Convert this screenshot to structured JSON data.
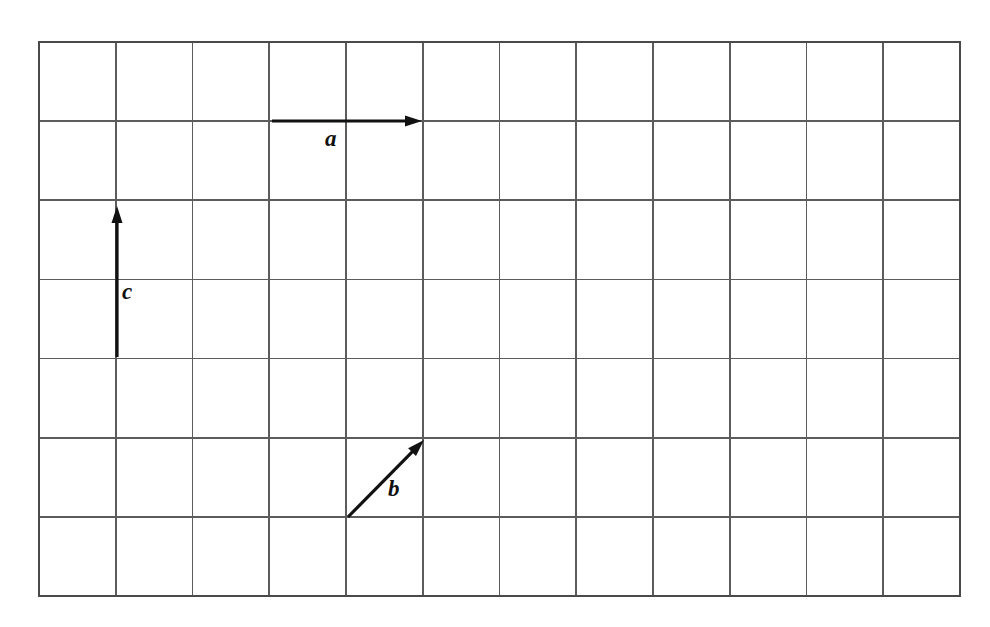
{
  "figure": {
    "background_color": "#ffffff",
    "grid": {
      "columns": 12,
      "rows": 7,
      "left": 39,
      "top": 42,
      "right": 960,
      "bottom": 596,
      "cell_width": 76.75,
      "cell_height": 79.14,
      "line_color": "#5c5c5c",
      "border_color": "#4a4a4a",
      "show_grid": true
    },
    "vectors": [
      {
        "name": "a",
        "label": "a",
        "color": "#111111",
        "start_px": [
          272,
          121
        ],
        "end_px": [
          422,
          121
        ],
        "start_cell": [
          3,
          1
        ],
        "end_cell": [
          5,
          1
        ],
        "components_cells": [
          2,
          0
        ],
        "direction": "right",
        "label_px": [
          325,
          127
        ]
      },
      {
        "name": "b",
        "label": "b",
        "color": "#111111",
        "start_px": [
          348,
          517
        ],
        "end_px": [
          424,
          440
        ],
        "start_cell": [
          4,
          6
        ],
        "end_cell": [
          5,
          5
        ],
        "components_cells": [
          1,
          1
        ],
        "direction": "up-right",
        "label_px": [
          388,
          477
        ]
      },
      {
        "name": "c",
        "label": "c",
        "color": "#111111",
        "start_px": [
          117,
          357
        ],
        "end_px": [
          117,
          206
        ],
        "start_cell": [
          1,
          4
        ],
        "end_cell": [
          1,
          2
        ],
        "components_cells": [
          0,
          2
        ],
        "direction": "up",
        "label_px": [
          122,
          280
        ]
      }
    ]
  },
  "chart_data": {
    "type": "scatter",
    "title": "",
    "xlabel": "",
    "ylabel": "",
    "grid": true,
    "xlim": [
      0,
      12
    ],
    "ylim": [
      0,
      7
    ],
    "series": [
      {
        "name": "a",
        "tail": [
          3,
          6
        ],
        "head": [
          5,
          6
        ],
        "dx": 2,
        "dy": 0
      },
      {
        "name": "b",
        "tail": [
          4,
          1
        ],
        "head": [
          5,
          2
        ],
        "dx": 1,
        "dy": 1
      },
      {
        "name": "c",
        "tail": [
          1,
          3
        ],
        "head": [
          1,
          5
        ],
        "dx": 0,
        "dy": 2
      }
    ],
    "annotations": [
      "a",
      "b",
      "c"
    ]
  }
}
